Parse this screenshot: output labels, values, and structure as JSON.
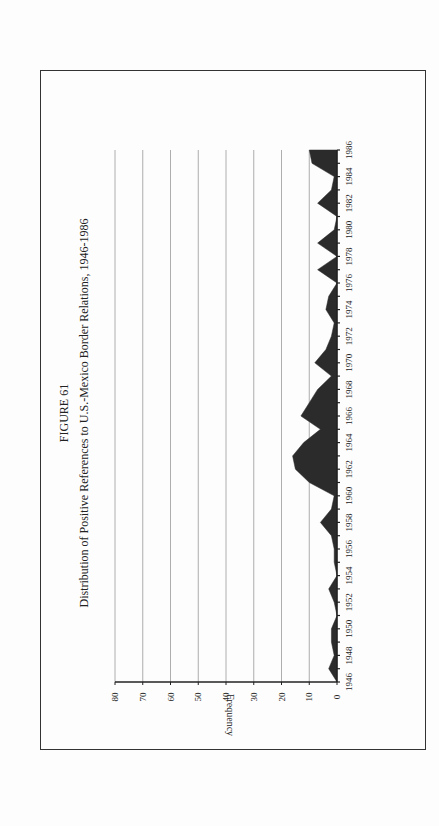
{
  "figure": {
    "label": "FIGURE 61",
    "title": "Distribution of Positive References to U.S.-Mexico Border Relations, 1946-1986"
  },
  "chart_data": {
    "type": "area",
    "orientation": "rotated 90° counter-clockwise",
    "title": "Distribution of Positive References to U.S.-Mexico Border Relations, 1946-1986",
    "figure_label": "FIGURE 61",
    "xlabel": "",
    "ylabel": "Frequency",
    "ylim": [
      0,
      80
    ],
    "yticks": [
      0,
      10,
      20,
      30,
      40,
      50,
      60,
      70,
      80
    ],
    "xtick_labels": [
      "1946",
      "1948",
      "1950",
      "1952",
      "1954",
      "1956",
      "1958",
      "1960",
      "1962",
      "1964",
      "1966",
      "1968",
      "1970",
      "1972",
      "1974",
      "1976",
      "1978",
      "1980",
      "1982",
      "1984",
      "1986"
    ],
    "grid": true,
    "legend": null,
    "x": [
      1946,
      1947,
      1948,
      1949,
      1950,
      1951,
      1952,
      1953,
      1954,
      1955,
      1956,
      1957,
      1958,
      1959,
      1960,
      1961,
      1962,
      1963,
      1964,
      1965,
      1966,
      1967,
      1968,
      1969,
      1970,
      1971,
      1972,
      1973,
      1974,
      1975,
      1976,
      1977,
      1978,
      1979,
      1980,
      1981,
      1982,
      1983,
      1984,
      1985,
      1986
    ],
    "values": [
      0,
      3,
      1,
      2,
      2,
      0,
      1,
      3,
      0,
      1,
      1,
      2,
      6,
      2,
      1,
      10,
      15,
      16,
      12,
      6,
      13,
      10,
      7,
      2,
      8,
      4,
      2,
      1,
      4,
      3,
      0,
      7,
      0,
      7,
      1,
      0,
      7,
      2,
      1,
      9,
      10
    ],
    "fill_color": "#2b2b2b"
  }
}
